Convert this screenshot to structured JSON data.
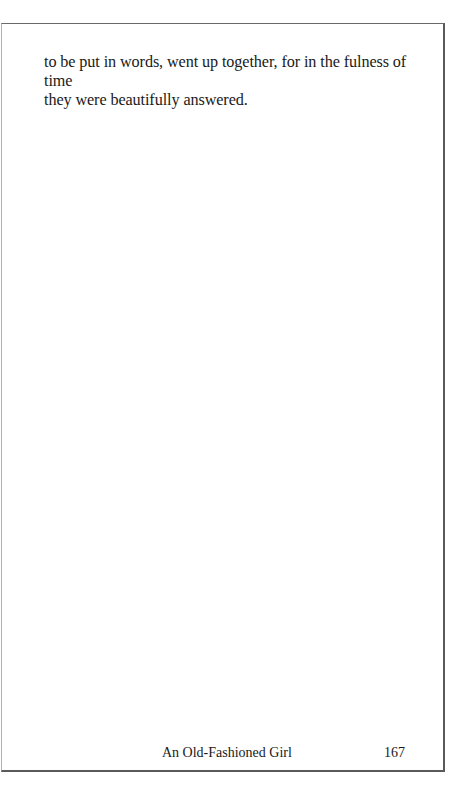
{
  "page": {
    "body_lines": [
      "to be put in words, went up together, for in the fulness of time",
      "they were beautifully answered."
    ],
    "footer": {
      "running_title": "An Old-Fashioned Girl",
      "page_number": "167"
    }
  }
}
